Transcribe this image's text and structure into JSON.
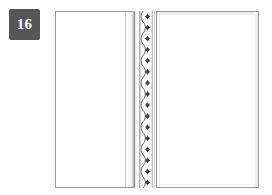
{
  "badge": {
    "number": "16",
    "background_color": "#565656",
    "text_color": "#ffffff"
  },
  "illustration": {
    "type": "book-spread",
    "description": "Open book spread, two blank facing leaves separated by a gutter with an ornamental scalloped border band",
    "background_color": "#ffffff",
    "outline_color": "#9a9a9a",
    "left_page": {
      "label": "Left page",
      "content": "",
      "fill_color": "#ffffff"
    },
    "gutter": {
      "label": "Gutter",
      "fill_color": "#f0f0f0"
    },
    "ornament": {
      "label": "Ornamental border band",
      "motif": "scalloped serpentine wave with floret medallions",
      "motif_count": 16,
      "line_color": "#4a4a4a",
      "floret_color": "#3a3a3a"
    },
    "right_page": {
      "label": "Right page",
      "content": "",
      "fill_color": "#ffffff"
    }
  }
}
